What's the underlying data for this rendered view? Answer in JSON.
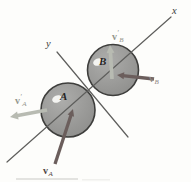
{
  "figure": {
    "type": "physics-diagram-oblique-impact",
    "colors": {
      "background": "#fdfdfb",
      "axis": "#5e5e5c",
      "ball_fill_light": "#adadab",
      "ball_fill_dark": "#8d8d8b",
      "ball_stroke": "#3e3e3c",
      "highlight": "#f4f4f1",
      "impact_vector": "#6b5e5c",
      "rebound_vector": "#b8bbb2"
    },
    "axes": [
      {
        "name": "x-axis",
        "label": "x",
        "x1": 7,
        "y1": 162,
        "x2": 171,
        "y2": 17,
        "label_x": 172,
        "label_y": 6
      },
      {
        "name": "y-axis",
        "label": "y",
        "x1": 57,
        "y1": 52,
        "x2": 128,
        "y2": 137,
        "label_x": 46,
        "label_y": 39
      }
    ],
    "balls": [
      {
        "name": "ball-A",
        "label": "A",
        "cx": 68,
        "cy": 110,
        "r": 27,
        "hx": 57,
        "hy": 99,
        "label_x": 60,
        "label_y": 91
      },
      {
        "name": "ball-B",
        "label": "B",
        "cx": 113,
        "cy": 70,
        "r": 25.5,
        "hx": 98,
        "hy": 62,
        "label_x": 99,
        "label_y": 56
      }
    ],
    "vectors": [
      {
        "name": "vA",
        "symbol": "v",
        "prime": "",
        "sub": "A",
        "kind": "before",
        "x1": 55,
        "y1": 164,
        "x2": 73,
        "y2": 109,
        "label_x": 43,
        "label_y": 164,
        "label_color": "#4f4442"
      },
      {
        "name": "vB",
        "symbol": "v",
        "prime": "",
        "sub": "B",
        "kind": "before",
        "x1": 154,
        "y1": 79,
        "x2": 117,
        "y2": 75,
        "label_x": 149,
        "label_y": 72,
        "label_color": "#8e8684"
      },
      {
        "name": "vA-prime",
        "symbol": "v",
        "prime": "′",
        "sub": "A",
        "kind": "after",
        "x1": 47,
        "y1": 110,
        "x2": 10,
        "y2": 117,
        "label_x": 15,
        "label_y": 94,
        "label_color": "#94968d"
      },
      {
        "name": "vB-prime",
        "symbol": "v",
        "prime": "′",
        "sub": "B",
        "kind": "after",
        "x1": 112,
        "y1": 79,
        "x2": 110,
        "y2": 45,
        "label_x": 112,
        "label_y": 30,
        "label_color": "#94968d"
      }
    ]
  }
}
